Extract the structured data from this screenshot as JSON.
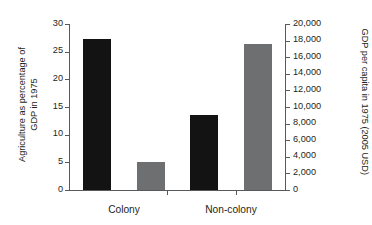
{
  "chart_data": {
    "type": "bar",
    "title": "",
    "categories": [
      "Colony",
      "Non-colony"
    ],
    "series": [
      {
        "name": "Agriculture as percentage of GDP in 1975",
        "axis": "left",
        "color": "#131313",
        "values": [
          27.3,
          13.5
        ]
      },
      {
        "name": "GDP per capita in 1975 (2005 USD)",
        "axis": "right",
        "color": "#6e6f71",
        "values": [
          3400,
          17600
        ]
      }
    ],
    "xlabel": "",
    "ylabel": "Agriculture as percentage of\nGDP in 1975",
    "y2label": "GDP per capita in 1975 (2005 USD)",
    "ylim": [
      0,
      30
    ],
    "y2lim": [
      0,
      20000
    ],
    "yticks": [
      0,
      5,
      10,
      15,
      20,
      25,
      30
    ],
    "ytick_labels": [
      "0",
      "5",
      "10",
      "15",
      "20",
      "25",
      "30"
    ],
    "y2ticks": [
      0,
      2000,
      4000,
      6000,
      8000,
      10000,
      12000,
      14000,
      16000,
      18000,
      20000
    ],
    "y2tick_labels": [
      "0",
      "2,000",
      "4,000",
      "6,000",
      "8,000",
      "10,000",
      "12,000",
      "14,000",
      "16,000",
      "18,000",
      "20,000"
    ],
    "grid": false,
    "legend": null,
    "legend_position": "none"
  },
  "axes": {
    "left_title": "Agriculture as percentage of\nGDP in 1975",
    "right_title": "GDP per capita in 1975 (2005 USD)"
  },
  "colors": {
    "agriculture_bar": "#131313",
    "gdp_bar": "#6e6f71",
    "axis_line": "#58595b",
    "text": "#231f20",
    "background": "#ffffff"
  }
}
